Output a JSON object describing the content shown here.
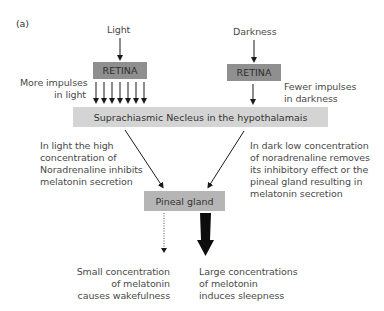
{
  "figure": {
    "panel_label": "(a)",
    "left": {
      "stimulus": "Light",
      "retina_label": "RETINA",
      "impulse_note": [
        "More impulses",
        "in light"
      ],
      "impulse_arrow_count": 7
    },
    "right": {
      "stimulus": "Darkness",
      "retina_label": "RETINA",
      "impulse_note": [
        "Fewer impulses",
        "in darkness"
      ],
      "impulse_arrow_count": 1
    },
    "scn_label": "Suprachiasmic Necleus in the hypothalamais",
    "left_explanation": [
      "In light the high",
      "concentration of",
      "Noradrenaline inhibits",
      "melatonin secretion"
    ],
    "right_explanation": [
      "In dark low concentration",
      "of noradrenaline removes",
      "its inhibitory effect or the",
      "pineal gland resulting in",
      "melatonin secretion"
    ],
    "pineal_label": "Pineal gland",
    "small_output": [
      "Small concentration",
      "of melatonin",
      "causes wakefulness"
    ],
    "large_output": [
      "Large concentrations",
      "of melotonin",
      "induces sleepness"
    ],
    "colors": {
      "retina_box": "#8f8f8f",
      "scn_box": "#d4d4d4",
      "pineal_box": "#b5b5b5",
      "text": "#4a4a4a",
      "arrow": "#1a1a1a"
    }
  }
}
